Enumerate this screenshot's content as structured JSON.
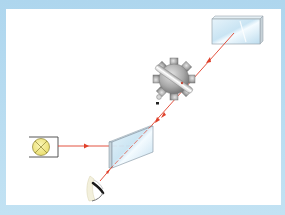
{
  "diagram": {
    "components": [
      {
        "id": "light-source",
        "icon": "lamp-icon"
      },
      {
        "id": "beam-splitter",
        "icon": "half-silvered-mirror-icon"
      },
      {
        "id": "toothed-wheel",
        "icon": "gear-icon"
      },
      {
        "id": "distant-mirror",
        "icon": "mirror-icon"
      },
      {
        "id": "observer",
        "icon": "eye-icon"
      }
    ],
    "colors": {
      "frame": "#b9dcef",
      "panel": "#ffffff",
      "beam": "#e0402a",
      "glass": "#d6ecf7",
      "glass_edge": "#8a9aa6",
      "lamp_fill": "#f5ec8a",
      "gear": "#9a9a9a"
    }
  }
}
